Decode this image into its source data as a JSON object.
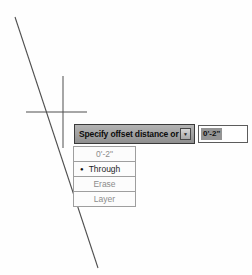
{
  "colors": {
    "canvas_bg": "#fefefe",
    "line_stroke": "#4f4f4f",
    "tooltip_bg": "#a4a4a4",
    "tooltip_border": "#3a3a3a",
    "tooltip_text": "#0c0c0c",
    "value_selection_bg": "#949494",
    "list_bg": "#fcfcfc",
    "list_border": "#9e9e9e",
    "muted_option_text": "#8c8c8c",
    "current_option_text": "#1f1f1f"
  },
  "drawing": {
    "line": {
      "x1": 15,
      "y1": 17,
      "x2": 98,
      "y2": 268
    },
    "crosshair": {
      "v_x": 63,
      "v_y1": 76,
      "v_y2": 148,
      "h_y": 112,
      "h_x1": 26,
      "h_x2": 87
    }
  },
  "dynamic_input": {
    "prompt": "Specify offset distance or",
    "value": "0'-2\"",
    "value_selected": true
  },
  "icons": {
    "down_arrow": "▼",
    "current_option_bullet": "●"
  },
  "dropdown": {
    "items": [
      {
        "label": "0'-2\"",
        "current": false
      },
      {
        "label": "Through",
        "current": true
      },
      {
        "label": "Erase",
        "current": false
      },
      {
        "label": "Layer",
        "current": false
      }
    ]
  }
}
